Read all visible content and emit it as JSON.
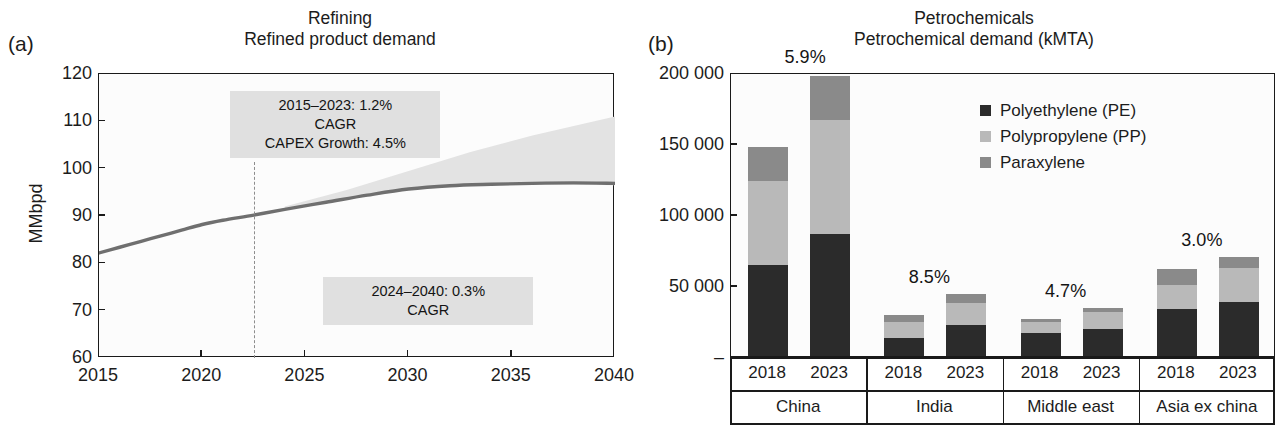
{
  "figure": {
    "panels": [
      {
        "letter": "(a)",
        "title_main": "Refining",
        "title_sub": "Refined product demand"
      },
      {
        "letter": "(b)",
        "title_main": "Petrochemicals",
        "title_sub": "Petrochemical demand (kMTA)"
      }
    ]
  },
  "colors": {
    "pe_dark": "#2b2b2b",
    "pp_light": "#b9b9b9",
    "px_mid": "#8a8a8a",
    "line": "#6f6f6f",
    "band": "#e3e3e3",
    "annot_bg": "#e0e0e0",
    "axis": "#1a1a1a",
    "plot_bg": "#fcfcfc"
  },
  "chart_data": [
    {
      "type": "line",
      "panel": "a",
      "title": "Refining",
      "subtitle": "Refined product demand",
      "xlabel": "",
      "ylabel": "MMbpd",
      "xlim": [
        2015,
        2040
      ],
      "ylim": [
        60,
        120
      ],
      "xticks": [
        2015,
        2020,
        2025,
        2030,
        2035,
        2040
      ],
      "xtick_labels": [
        "2015",
        "2020",
        "2025",
        "2030",
        "2035",
        "2040"
      ],
      "yticks": [
        60,
        70,
        80,
        90,
        100,
        110,
        120
      ],
      "ytick_labels": [
        "60",
        "70",
        "80",
        "90",
        "100",
        "110",
        "120"
      ],
      "grid": false,
      "legend": "none",
      "series": [
        {
          "name": "Refined product demand",
          "x": [
            2015,
            2016,
            2017,
            2018,
            2019,
            2020,
            2021,
            2022.5,
            2024,
            2026,
            2028,
            2030,
            2032,
            2034,
            2036,
            2038,
            2040
          ],
          "values": [
            82.2,
            83.4,
            84.6,
            85.8,
            87.0,
            88.2,
            89.1,
            90.2,
            91.4,
            92.9,
            94.4,
            95.7,
            96.4,
            96.7,
            96.9,
            97.0,
            96.9
          ]
        },
        {
          "name": "Uncertainty band upper",
          "x": [
            2024,
            2027,
            2030,
            2033,
            2036,
            2040
          ],
          "values": [
            92.0,
            95.5,
            99.5,
            103.5,
            107.0,
            111.0
          ]
        },
        {
          "name": "Uncertainty band lower",
          "x": [
            2024,
            2027,
            2030,
            2033,
            2036,
            2040
          ],
          "values": [
            91.4,
            93.5,
            95.5,
            96.4,
            96.8,
            96.5
          ]
        }
      ],
      "divider_x": 2022.5,
      "annotations": [
        {
          "id": "hist-cagr",
          "text": "2015–2023: 1.2%\nCAGR\nCAPEX Growth: 4.5%",
          "x_center": 2026.5,
          "y_center": 109.0
        },
        {
          "id": "fwd-cagr",
          "text": "2024–2040: 0.3%\nCAGR",
          "x_center": 2031.0,
          "y_center": 72.0
        }
      ]
    },
    {
      "type": "bar",
      "panel": "b",
      "stacked": true,
      "title": "Petrochemicals",
      "subtitle": "Petrochemical demand (kMTA)",
      "xlabel": "",
      "ylabel": "",
      "ylim": [
        0,
        200000
      ],
      "yticks": [
        0,
        50000,
        100000,
        150000,
        200000
      ],
      "ytick_labels": [
        "–",
        "50 000",
        "100 000",
        "150 000",
        "200 000"
      ],
      "grid": false,
      "legend_position": "upper right",
      "legend": [
        "Polyethylene (PE)",
        "Polypropylene (PP)",
        "Paraxylene"
      ],
      "categories": [
        "China 2018",
        "China 2023",
        "India 2018",
        "India 2023",
        "Middle east 2018",
        "Middle east 2023",
        "Asia ex china 2018",
        "Asia ex china 2023"
      ],
      "groups": [
        {
          "region": "Asia ex china",
          "label": "China",
          "cagr": "5.9%",
          "years": [
            "2018",
            "2023"
          ]
        },
        {
          "region": "India",
          "label": "India",
          "cagr": "8.5%",
          "years": [
            "2018",
            "2023"
          ]
        },
        {
          "region": "Middle east",
          "label": "Middle east",
          "cagr": "4.7%",
          "years": [
            "2018",
            "2023"
          ]
        },
        {
          "region": "Asia ex china",
          "label": "Asia ex china",
          "cagr": "3.0%",
          "years": [
            "2018",
            "2023"
          ]
        }
      ],
      "series": [
        {
          "name": "Polyethylene (PE)",
          "color": "#2b2b2b",
          "values": [
            64000,
            86000,
            13000,
            22000,
            16000,
            19000,
            33000,
            38000
          ]
        },
        {
          "name": "Polypropylene (PP)",
          "color": "#b9b9b9",
          "values": [
            59000,
            80000,
            11000,
            15000,
            8000,
            12000,
            17000,
            24000
          ]
        },
        {
          "name": "Paraxylene",
          "color": "#8a8a8a",
          "values": [
            24000,
            31000,
            5000,
            7000,
            2000,
            3000,
            11000,
            8000
          ]
        }
      ],
      "totals": [
        147000,
        197000,
        29000,
        44000,
        26000,
        34000,
        61000,
        70000
      ]
    }
  ]
}
